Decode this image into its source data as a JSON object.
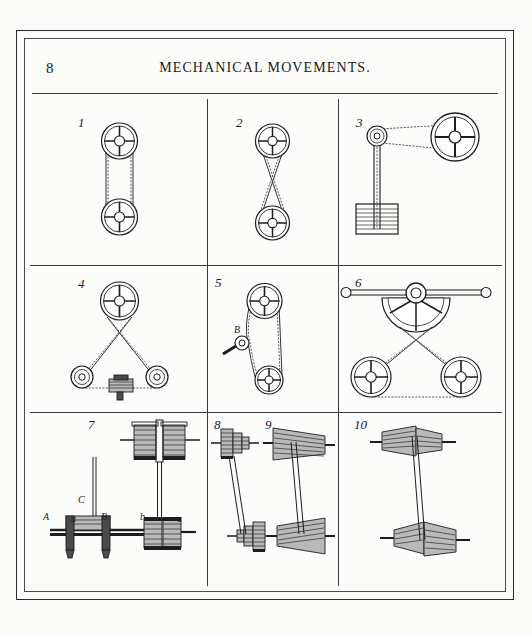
{
  "page": {
    "number": "8",
    "title": "MECHANICAL MOVEMENTS.",
    "title_first_letters": "M M",
    "paper_color": "#fcfcfb",
    "ink_color": "#1d1d1d"
  },
  "plate": {
    "rows": 3,
    "columns": 3,
    "figure_count": 10,
    "figures": [
      {
        "number": "1",
        "caption_label": "1",
        "kind": "open-belt-two-pulleys",
        "labels": []
      },
      {
        "number": "2",
        "caption_label": "2",
        "kind": "crossed-belt-two-pulleys",
        "labels": []
      },
      {
        "number": "3",
        "caption_label": "3",
        "kind": "weighted-belt-tightener",
        "labels": []
      },
      {
        "number": "4",
        "caption_label": "4",
        "kind": "three-pulley-triangle-tensioner",
        "labels": []
      },
      {
        "number": "5",
        "caption_label": "5",
        "kind": "idler-arm-belt-tightener",
        "labels": [
          "B"
        ]
      },
      {
        "number": "6",
        "caption_label": "6",
        "kind": "rocking-sector-two-pulleys",
        "labels": []
      },
      {
        "number": "7",
        "caption_label": "7",
        "kind": "belt-shifter-fork-fast-loose-pulleys",
        "labels": [
          "A",
          "a",
          "B",
          "b",
          "C",
          "a"
        ]
      },
      {
        "number": "8",
        "caption_label": "8",
        "kind": "stepped-cone-pulleys",
        "labels": []
      },
      {
        "number": "9",
        "caption_label": "9",
        "kind": "conical-drums-opposed",
        "labels": []
      },
      {
        "number": "10",
        "caption_label": "10",
        "kind": "conical-drums-crossed",
        "labels": []
      }
    ]
  },
  "figure5": {
    "label_b": "B"
  },
  "figure7": {
    "label_a_upper": "A",
    "label_a_lower": "a",
    "label_b_upper": "B",
    "label_b_lower": "b",
    "label_c": "C",
    "label_a_right": "a"
  }
}
